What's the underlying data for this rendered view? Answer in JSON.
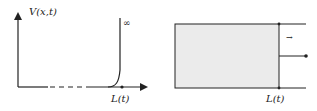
{
  "left_panel": {
    "y_axis_label": "V(x,t)",
    "x_axis_marker_label": "L(t)",
    "curve_label": "∞"
  },
  "right_panel": {
    "boundary_label": "L(t)",
    "motion_arrow": "→"
  },
  "colors": {
    "line": "#222222",
    "box_fill": "#ebebeb"
  }
}
